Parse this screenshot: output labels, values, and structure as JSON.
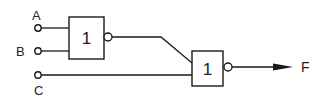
{
  "diagram": {
    "type": "logic-circuit",
    "stroke_color": "#1a1a1a",
    "background": "#ffffff",
    "inputs": [
      {
        "id": "A",
        "label": "A"
      },
      {
        "id": "B",
        "label": "B"
      },
      {
        "id": "C",
        "label": "C"
      }
    ],
    "gates": [
      {
        "id": "g1",
        "symbol": "1",
        "type": "NOR",
        "inputs": [
          "A",
          "B"
        ]
      },
      {
        "id": "g2",
        "symbol": "1",
        "type": "NOR",
        "inputs": [
          "g1",
          "C"
        ]
      }
    ],
    "output": {
      "id": "F",
      "label": "F"
    }
  }
}
